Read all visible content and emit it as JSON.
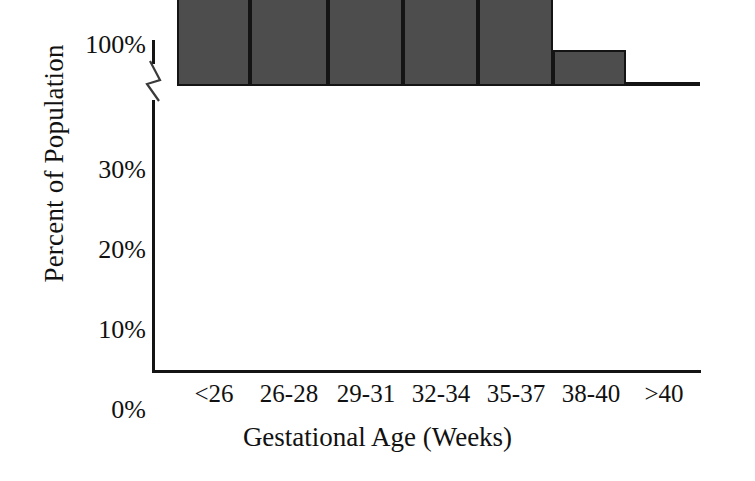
{
  "chart_data": {
    "type": "bar",
    "title": "",
    "xlabel": "Gestational Age (Weeks)",
    "ylabel": "Percent of Population",
    "categories": [
      "<26",
      "26-28",
      "29-31",
      "32-34",
      "35-37",
      "38-40",
      ">40"
    ],
    "values": [
      5.5,
      10.7,
      18.0,
      29.8,
      19.0,
      10.7,
      4.3
    ],
    "ytick_labels": [
      "100%",
      "30%",
      "20%",
      "10%",
      "0%"
    ],
    "ytick_values": [
      100,
      30,
      20,
      10,
      0
    ],
    "ylim": [
      0,
      30
    ],
    "axis_break": true,
    "axis_break_note": "y-axis broken between 30% and 100%",
    "grid": false,
    "legend": false,
    "bar_fill_color": "#4d4d4d",
    "bar_edge_color": "#141414",
    "axis_color": "#141414",
    "background_color": "#ffffff"
  }
}
